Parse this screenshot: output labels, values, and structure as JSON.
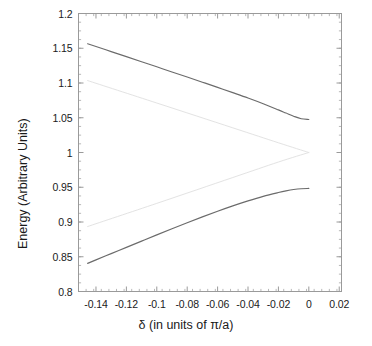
{
  "chart_data": {
    "type": "line",
    "title": "",
    "xlabel": "δ (in units of π/a)",
    "ylabel": "Energy (Arbitrary Units)",
    "xlim": [
      -0.1515,
      0.0215
    ],
    "ylim": [
      0.8,
      1.2
    ],
    "grid": false,
    "legend": null,
    "x_ticks": [
      -0.14,
      -0.12,
      -0.1,
      -0.08,
      -0.06,
      -0.04,
      -0.02,
      0,
      0.02
    ],
    "x_tick_labels": [
      "-0.14",
      "-0.12",
      "-0.1",
      "-0.08",
      "-0.06",
      "-0.04",
      "-0.02",
      "0",
      "0.02"
    ],
    "y_ticks": [
      0.8,
      0.85,
      0.9,
      0.95,
      1.0,
      1.05,
      1.1,
      1.15,
      1.2
    ],
    "y_tick_labels": [
      "0.8",
      "0.85",
      "0.9",
      "0.95",
      "1",
      "1.05",
      "1.1",
      "1.15",
      "1.2"
    ],
    "x_minor_tick_step": 0.005,
    "y_minor_tick_step": 0.0125,
    "line_color": "#6b6b6b",
    "unperturbed_color": "#e3e3e3",
    "axis_color": "#9a9a9a",
    "series": [
      {
        "name": "upper-band",
        "color": "#6b6b6b",
        "x": [
          -0.1455,
          -0.14,
          -0.13,
          -0.12,
          -0.11,
          -0.1,
          -0.09,
          -0.08,
          -0.07,
          -0.06,
          -0.05,
          -0.04,
          -0.03,
          -0.02,
          -0.015,
          -0.01,
          -0.005,
          0.0
        ],
        "y": [
          1.1565,
          1.1525,
          1.1452,
          1.1379,
          1.1306,
          1.1233,
          1.1159,
          1.1086,
          1.1012,
          1.0937,
          1.0861,
          1.0784,
          1.0702,
          1.0613,
          1.0567,
          1.0522,
          1.0486,
          1.0475
        ]
      },
      {
        "name": "lower-band",
        "color": "#6b6b6b",
        "x": [
          -0.1455,
          -0.14,
          -0.13,
          -0.12,
          -0.11,
          -0.1,
          -0.09,
          -0.08,
          -0.07,
          -0.06,
          -0.05,
          -0.04,
          -0.03,
          -0.02,
          -0.015,
          -0.01,
          -0.005,
          0.0
        ],
        "y": [
          0.8405,
          0.8455,
          0.8545,
          0.8635,
          0.8725,
          0.8815,
          0.8903,
          0.899,
          0.9074,
          0.9155,
          0.9232,
          0.9304,
          0.9369,
          0.9424,
          0.9448,
          0.9467,
          0.9479,
          0.9483
        ]
      },
      {
        "name": "unperturbed-upper",
        "color": "#e3e3e3",
        "x": [
          -0.1455,
          -0.1,
          -0.05,
          -0.02,
          0.0
        ],
        "y": [
          0.8935,
          0.9268,
          0.964,
          0.9863,
          1.0
        ]
      },
      {
        "name": "unperturbed-lower",
        "color": "#e3e3e3",
        "x": [
          -0.1455,
          -0.1,
          -0.05,
          -0.02,
          0.0
        ],
        "y": [
          1.1035,
          1.0712,
          1.0355,
          1.014,
          1.0
        ]
      }
    ],
    "annotations": []
  }
}
